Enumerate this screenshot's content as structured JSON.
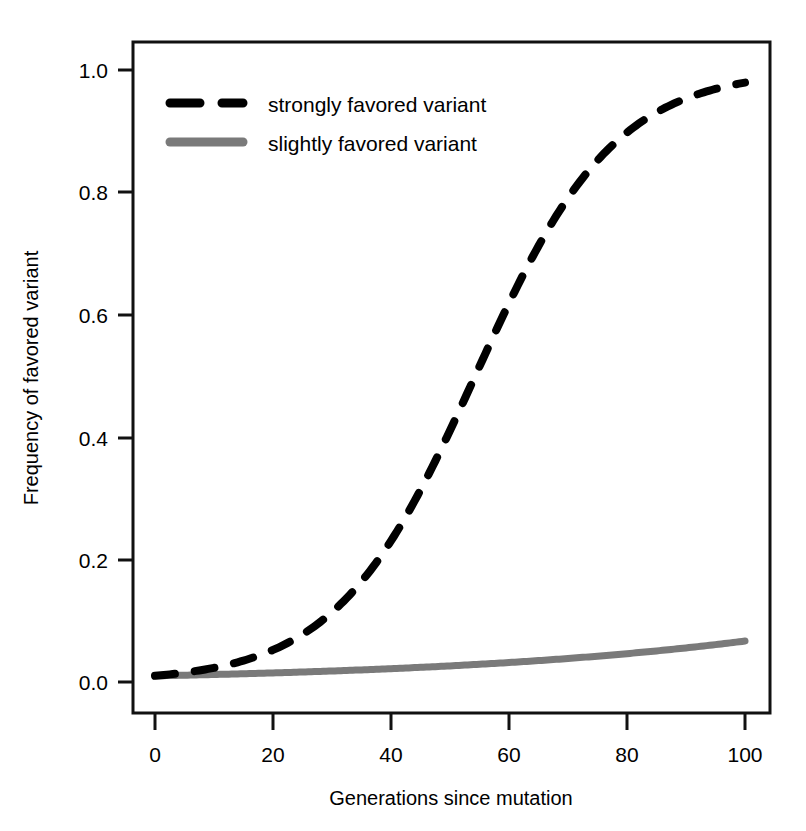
{
  "chart_data": {
    "type": "line",
    "title": "",
    "xlabel": "Generations since mutation",
    "ylabel": "Frequency of favored variant",
    "xlim": [
      0,
      100
    ],
    "ylim": [
      0,
      1
    ],
    "xticks": [
      "0",
      "20",
      "40",
      "60",
      "80",
      "100"
    ],
    "xtick_values": [
      0,
      20,
      40,
      60,
      80,
      100
    ],
    "yticks": [
      "0.0",
      "0.2",
      "0.4",
      "0.6",
      "0.8",
      "1.0"
    ],
    "ytick_values": [
      0.0,
      0.2,
      0.4,
      0.6,
      0.8,
      1.0
    ],
    "grid": false,
    "legend_position": "top-left inside axes",
    "x": [
      0,
      5,
      10,
      15,
      20,
      25,
      30,
      35,
      40,
      45,
      50,
      55,
      60,
      65,
      70,
      75,
      80,
      85,
      90,
      95,
      100
    ],
    "series": [
      {
        "name": "strongly favored variant",
        "color": "#000000",
        "style": "dashed",
        "linewidth": 7,
        "values": [
          0.01,
          0.014,
          0.02,
          0.028,
          0.039,
          0.055,
          0.076,
          0.104,
          0.141,
          0.188,
          0.248,
          0.32,
          0.402,
          0.49,
          0.578,
          0.66,
          0.732,
          0.793,
          0.842,
          0.88,
          0.909
        ]
      },
      {
        "name": "slightly favored variant",
        "color": "#7a7a7a",
        "style": "solid",
        "linewidth": 6,
        "values": [
          0.01,
          0.0109,
          0.0119,
          0.013,
          0.0142,
          0.0155,
          0.0169,
          0.0184,
          0.02,
          0.0218,
          0.0238,
          0.0259,
          0.0282,
          0.0307,
          0.0334,
          0.0363,
          0.0395,
          0.0429,
          0.0466,
          0.0506,
          0.0549
        ]
      }
    ]
  },
  "legend": {
    "entries": [
      {
        "label": "strongly favored variant",
        "swatch": "dashed-black-line"
      },
      {
        "label": "slightly favored variant",
        "swatch": "solid-gray-line"
      }
    ]
  },
  "axes": {
    "x_title": "Generations since mutation",
    "y_title": "Frequency of favored variant",
    "x_tick_labels": [
      "0",
      "20",
      "40",
      "60",
      "80",
      "100"
    ],
    "y_tick_labels": [
      "0.0",
      "0.2",
      "0.4",
      "0.6",
      "0.8",
      "1.0"
    ]
  },
  "colors": {
    "strong_variant": "#000000",
    "slight_variant": "#7a7a7a",
    "frame": "#111111",
    "background": "#ffffff"
  }
}
